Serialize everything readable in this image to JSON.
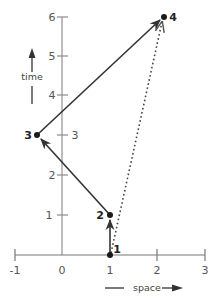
{
  "diagram": {
    "type": "spacetime-path",
    "axes": {
      "x": {
        "label": "space",
        "ticks": [
          "-1",
          "0",
          "1",
          "2",
          "3"
        ],
        "range": [
          -1,
          3
        ]
      },
      "y": {
        "label": "time",
        "ticks": [
          "1",
          "2",
          "3",
          "4",
          "5",
          "6"
        ],
        "range": [
          0,
          6
        ]
      }
    },
    "events": [
      {
        "id": "1",
        "label": "1",
        "x": 1,
        "t": 0
      },
      {
        "id": "2",
        "label": "2",
        "x": 1,
        "t": 1
      },
      {
        "id": "3",
        "label": "3",
        "x": -0.55,
        "t": 3
      },
      {
        "id": "4",
        "label": "4",
        "x": 2.15,
        "t": 6
      }
    ],
    "paths": [
      {
        "from": "1",
        "to": "2",
        "style": "solid-arrow"
      },
      {
        "from": "2",
        "to": "3",
        "style": "solid-arrow"
      },
      {
        "from": "3",
        "to": "4",
        "style": "solid-arrow"
      },
      {
        "from": "1",
        "to": "4",
        "style": "dotted-arrow"
      }
    ],
    "extra_labels": {
      "tick_3_right": "3"
    },
    "colors": {
      "axis": "#9a9a9a",
      "path": "#333333",
      "dot": "#1a1a1a"
    }
  }
}
